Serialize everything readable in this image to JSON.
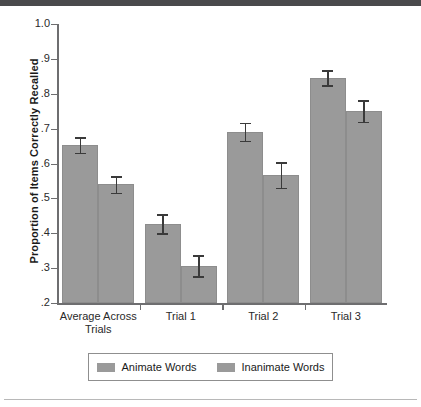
{
  "chart_data": {
    "type": "bar",
    "title": "",
    "xlabel": "",
    "ylabel": "Proportion of Items Correctly Recalled",
    "categories": [
      "Average Across Trials",
      "Trial 1",
      "Trial 2",
      "Trial 3"
    ],
    "category_lines": [
      [
        "Average Across",
        "Trials"
      ],
      [
        "Trial 1",
        ""
      ],
      [
        "Trial 2",
        ""
      ],
      [
        "Trial 3",
        ""
      ]
    ],
    "ylim": [
      0.2,
      1.0
    ],
    "ytick_labels": [
      "1.0",
      ".9",
      ".8",
      ".7",
      ".6",
      ".5",
      ".4",
      ".3",
      ".2"
    ],
    "ytick_values": [
      1.0,
      0.9,
      0.8,
      0.7,
      0.6,
      0.5,
      0.4,
      0.3,
      0.2
    ],
    "grid": false,
    "legend_position": "bottom",
    "series": [
      {
        "name": "Animate Words",
        "color": "#9a9a9a",
        "values": [
          0.653,
          0.427,
          0.691,
          0.846
        ],
        "errors": [
          0.022,
          0.027,
          0.026,
          0.021
        ]
      },
      {
        "name": "Inanimate Words",
        "color": "#9a9a9a",
        "values": [
          0.54,
          0.307,
          0.567,
          0.75
        ],
        "errors": [
          0.024,
          0.03,
          0.036,
          0.031
        ]
      }
    ]
  },
  "legend": {
    "items": [
      {
        "label": "Animate Words"
      },
      {
        "label": "Inanimate Words"
      }
    ]
  },
  "axis": {
    "y_title": "Proportion of Items Correctly Recalled"
  }
}
